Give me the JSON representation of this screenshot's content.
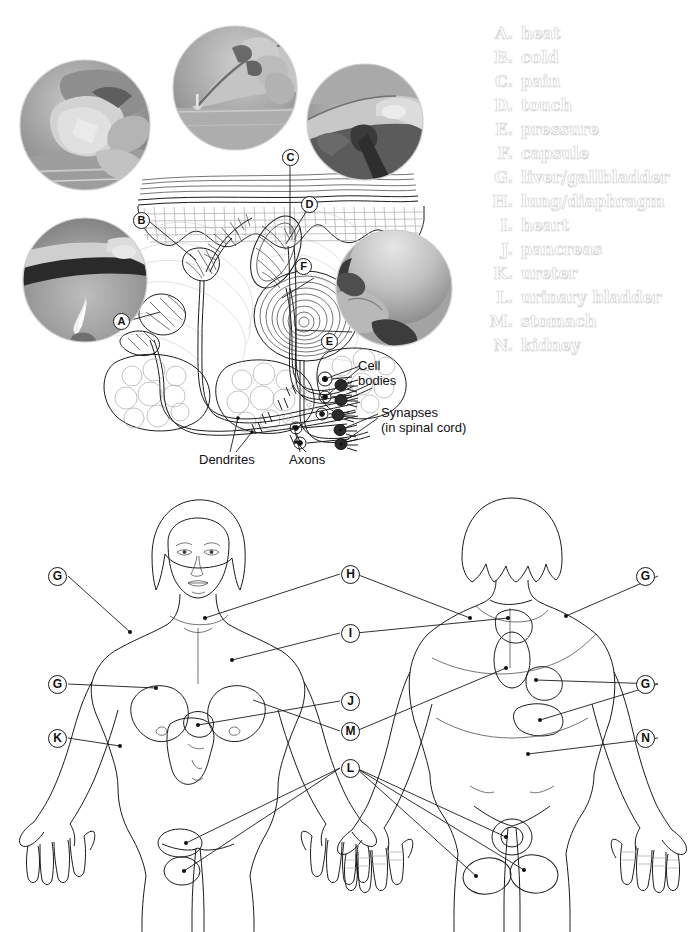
{
  "page": {
    "width": 694,
    "height": 932,
    "background": "#ffffff"
  },
  "legend": {
    "heading": "",
    "text_color": "#d2d2d4",
    "items": [
      {
        "letter": "A.",
        "label": "heat"
      },
      {
        "letter": "B.",
        "label": "cold"
      },
      {
        "letter": "C.",
        "label": "pain"
      },
      {
        "letter": "D.",
        "label": "touch"
      },
      {
        "letter": "E.",
        "label": "pressure"
      },
      {
        "letter": "F.",
        "label": "capsule"
      },
      {
        "letter": "G.",
        "label": "liver/gallbladder"
      },
      {
        "letter": "H.",
        "label": "lung/diaphragm"
      },
      {
        "letter": "I.",
        "label": "heart"
      },
      {
        "letter": "J.",
        "label": "pancreas"
      },
      {
        "letter": "K.",
        "label": "ureter"
      },
      {
        "letter": "L.",
        "label": "urinary bladder"
      },
      {
        "letter": "M.",
        "label": "stomach"
      },
      {
        "letter": "N.",
        "label": "kidney"
      }
    ]
  },
  "skin_diagram": {
    "photo_circles": [
      {
        "name": "cold-photo",
        "subject": "hand holding an ice cube over a dish",
        "tag": "B"
      },
      {
        "name": "pain-photo",
        "subject": "fingertip pressing a pin point",
        "tag": "C"
      },
      {
        "name": "touch-photo",
        "subject": "fingertip touching a surface",
        "tag": "D"
      },
      {
        "name": "pressure-photo",
        "subject": "hand cradling a smooth ball",
        "tag": "E"
      },
      {
        "name": "heat-photo",
        "subject": "hand held above a candle flame",
        "tag": "A"
      }
    ],
    "tags": [
      {
        "letter": "A"
      },
      {
        "letter": "B"
      },
      {
        "letter": "C"
      },
      {
        "letter": "D"
      },
      {
        "letter": "E"
      },
      {
        "letter": "F"
      }
    ],
    "annotations": [
      {
        "name": "cell-bodies-label",
        "text": "Cell\nbodies"
      },
      {
        "name": "synapses-label",
        "text": "Synapses\n(in spinal cord)"
      },
      {
        "name": "dendrites-label",
        "text": "Dendrites"
      },
      {
        "name": "axons-label",
        "text": "Axons"
      }
    ]
  },
  "body_figures": {
    "front": {
      "name": "anterior-female-figure",
      "view": "anterior",
      "tags_left": [
        {
          "letter": "G"
        },
        {
          "letter": "G"
        },
        {
          "letter": "K"
        }
      ],
      "tags_right": [
        {
          "letter": "H"
        },
        {
          "letter": "I"
        },
        {
          "letter": "J"
        },
        {
          "letter": "M"
        },
        {
          "letter": "L"
        }
      ]
    },
    "back": {
      "name": "posterior-female-figure",
      "view": "posterior",
      "tags_right": [
        {
          "letter": "G"
        },
        {
          "letter": "G"
        },
        {
          "letter": "N"
        }
      ]
    }
  },
  "colors": {
    "ink": "#1b1b1b",
    "mid_gray": "#8a8a8e",
    "light_gray": "#cfcfd3",
    "legend_gray": "#d2d2d4",
    "photo_gray": "#9a9a9a"
  }
}
